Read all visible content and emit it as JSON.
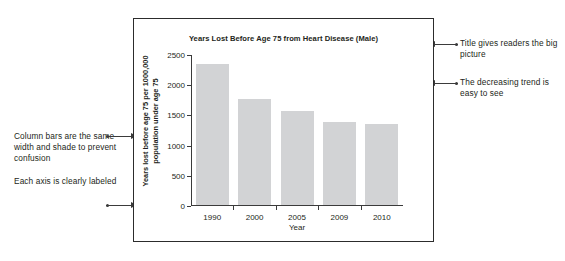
{
  "annotations": {
    "left": [
      {
        "id": "bars",
        "text": "Column bars are the same width and shade to prevent confusion"
      },
      {
        "id": "axis",
        "text": "Each axis is clearly labeled"
      }
    ],
    "right": [
      {
        "id": "title",
        "text": "Title gives readers the big picture"
      },
      {
        "id": "trend",
        "text": "The decreasing trend is easy to see"
      }
    ]
  },
  "chart_data": {
    "type": "bar",
    "title": "Years Lost Before Age 75 from Heart Disease (Male)",
    "xlabel": "Year",
    "ylabel": "Years lost before age 75 per 1000,000 population under age 75",
    "categories": [
      "1990",
      "2000",
      "2005",
      "2009",
      "2010"
    ],
    "values": [
      2335,
      1760,
      1550,
      1370,
      1335
    ],
    "ylim": [
      0,
      2500
    ],
    "yticks": [
      0,
      500,
      1000,
      1500,
      2000,
      2500
    ],
    "ytick_labels": [
      "0",
      "500",
      "1000",
      "1500",
      "2000",
      "2500"
    ],
    "grid": false,
    "legend": null,
    "bar_color": "#d2d3d5",
    "axis_color": "#3b3b3b"
  }
}
